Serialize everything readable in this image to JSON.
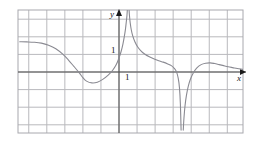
{
  "figure": {
    "axis_labels": {
      "x": "x",
      "y": "y"
    },
    "tick_labels": {
      "y_one": "1",
      "x_one": "1"
    },
    "colors": {
      "grid": "#b9b9bd",
      "frame": "#a8a8ae",
      "axis": "#4a4a4a",
      "curve": "#8a8a92",
      "background": "#ffffff",
      "text": "#1a1a1a"
    }
  },
  "chart_data": {
    "type": "line",
    "title": "",
    "xlabel": "x",
    "ylabel": "y",
    "xlim": [
      -5.5,
      7.0
    ],
    "ylim": [
      -3.5,
      3.5
    ],
    "grid": true,
    "legend": null,
    "x_tick_labels": [
      "1"
    ],
    "y_tick_labels": [
      "1"
    ],
    "x_ticks": [
      1
    ],
    "y_ticks": [
      1
    ],
    "grid_spacing": {
      "x": 1,
      "y": 1
    },
    "asymptotes": {
      "vertical": [
        0.5,
        3.5
      ],
      "horizontal": [
        0
      ]
    },
    "features": {
      "left_plateau_y": 1.7,
      "local_min": {
        "x": -2.0,
        "y": -0.6
      },
      "local_max_right": {
        "x": 5.0,
        "y": 0.5
      },
      "x_intercepts": [
        -0.05
      ],
      "end_behavior_left": 1.7,
      "end_behavior_right": 0.05
    },
    "series": [
      {
        "name": "curve",
        "branches": [
          {
            "name": "left-branch",
            "x": [
              -5.5,
              -5.1,
              -4.7,
              -4.3,
              -3.9,
              -3.5,
              -3.1,
              -2.8,
              -2.5,
              -2.2,
              -2.0,
              -1.8,
              -1.5,
              -1.2,
              -0.9,
              -0.6,
              -0.35,
              -0.15,
              0.0,
              0.12,
              0.22,
              0.3,
              0.36,
              0.41,
              0.44,
              0.46
            ],
            "y": [
              1.72,
              1.71,
              1.69,
              1.64,
              1.52,
              1.32,
              1.0,
              0.68,
              0.32,
              -0.05,
              -0.32,
              -0.52,
              -0.62,
              -0.58,
              -0.42,
              -0.18,
              0.1,
              0.42,
              0.8,
              1.18,
              1.6,
              2.05,
              2.45,
              2.9,
              3.2,
              3.5
            ]
          },
          {
            "name": "middle-branch",
            "x": [
              0.56,
              0.58,
              0.62,
              0.68,
              0.76,
              0.88,
              1.02,
              1.2,
              1.42,
              1.68,
              1.95,
              2.2,
              2.45,
              2.7,
              2.9,
              3.05,
              3.18,
              3.28,
              3.35,
              3.4,
              3.44
            ],
            "y": [
              3.5,
              3.2,
              2.8,
              2.4,
              2.05,
              1.72,
              1.45,
              1.22,
              1.02,
              0.86,
              0.74,
              0.64,
              0.56,
              0.46,
              0.36,
              0.22,
              0.02,
              -0.35,
              -0.9,
              -1.8,
              -3.3
            ]
          },
          {
            "name": "right-branch",
            "x": [
              3.56,
              3.6,
              3.66,
              3.74,
              3.84,
              3.96,
              4.1,
              4.3,
              4.55,
              4.8,
              5.05,
              5.3,
              5.55,
              5.8,
              6.05,
              6.3,
              6.55,
              6.8,
              7.0
            ],
            "y": [
              -3.3,
              -2.6,
              -1.9,
              -1.3,
              -0.8,
              -0.4,
              -0.08,
              0.22,
              0.42,
              0.5,
              0.52,
              0.48,
              0.42,
              0.36,
              0.3,
              0.25,
              0.2,
              0.16,
              0.13
            ]
          }
        ]
      }
    ]
  }
}
